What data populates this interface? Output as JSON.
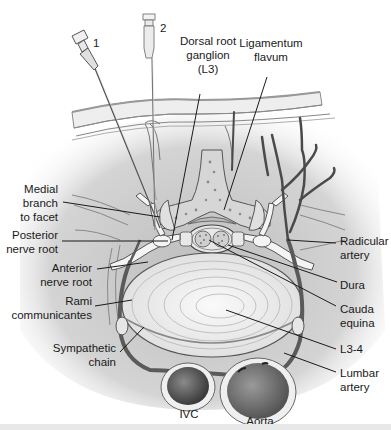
{
  "figure": {
    "needles": [
      {
        "id": "needle-1",
        "label": "1"
      },
      {
        "id": "needle-2",
        "label": "2"
      }
    ],
    "labels": {
      "dorsal_root_ganglion": [
        "Dorsal root",
        "ganglion",
        "(L3)"
      ],
      "ligamentum_flavum": [
        "Ligamentum",
        "flavum"
      ],
      "medial_branch": [
        "Medial",
        "branch",
        "to facet"
      ],
      "posterior_nerve_root": [
        "Posterior",
        "nerve root"
      ],
      "anterior_nerve_root": [
        "Anterior",
        "nerve root"
      ],
      "rami_communicantes": [
        "Rami",
        "communicantes"
      ],
      "sympathetic_chain": [
        "Sympathetic",
        "chain"
      ],
      "radicular_artery": [
        "Radicular",
        "artery"
      ],
      "dura": [
        "Dura"
      ],
      "cauda_equina": [
        "Cauda",
        "equina"
      ],
      "l3_4": [
        "L3-4"
      ],
      "lumbar_artery": [
        "Lumbar",
        "artery"
      ],
      "ivc": [
        "IVC"
      ],
      "aorta": [
        "Aorta"
      ]
    },
    "colors": {
      "background": "#ffffff",
      "tissue": "#c8c8c8",
      "tissue_light": "#e2e2e2",
      "bone": "#d9d9d9",
      "bone_spots": "#8a8a8a",
      "disc": "#f2f2f2",
      "vessel": "#5a5a5a",
      "vessel_dark": "#3c3c3c",
      "nerve": "#f4f4f4",
      "outline": "#555555",
      "text": "#1a1a1a"
    }
  }
}
